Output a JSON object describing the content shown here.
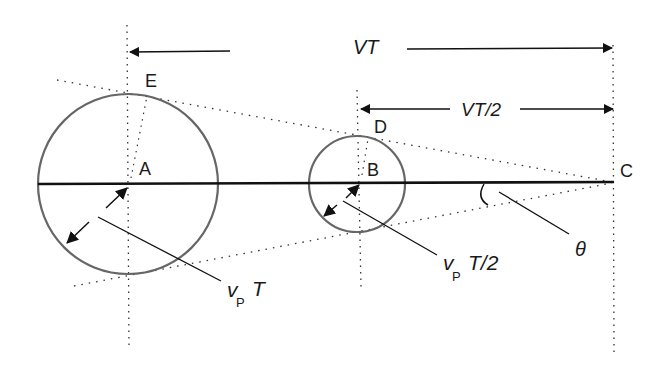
{
  "diagram": {
    "points": {
      "A": "A",
      "B": "B",
      "C": "C",
      "D": "D",
      "E": "E"
    },
    "dimensions": {
      "vt_label_main": "VT",
      "vt_half_label_main": "VT/2"
    },
    "radii": {
      "large_v": "v",
      "large_sub": "P",
      "large_rest": "T",
      "small_v": "v",
      "small_sub": "P",
      "small_rest": "T/2"
    },
    "angle": {
      "label": "θ"
    },
    "colors": {
      "circle_stroke": "#666666",
      "line_stroke": "#111111",
      "dotted_stroke": "#333333",
      "background": "#ffffff"
    }
  }
}
